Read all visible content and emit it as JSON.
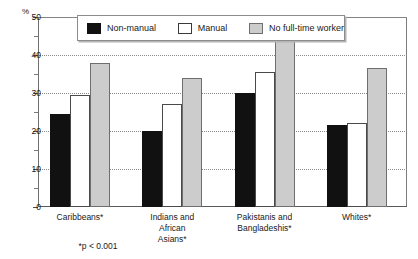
{
  "chart_data": {
    "type": "bar",
    "title": "",
    "subtitle": "",
    "xlabel": "",
    "ylabel": "%",
    "ylim": [
      0,
      50
    ],
    "yticks": [
      0,
      10,
      20,
      30,
      40,
      50
    ],
    "ytick_labels": [
      "0",
      "10",
      "20",
      "30",
      "40",
      "50"
    ],
    "minor_yticks": [
      5,
      15,
      25,
      35,
      45
    ],
    "grid": "horizontal dotted gridlines at major ticks",
    "legend_position": "top-center inside plot",
    "categories": [
      "Caribbeans*",
      "Indians and African Asians*",
      "Pakistanis and Bangladeshis*",
      "Whites*"
    ],
    "series": [
      {
        "name": "Non-manual",
        "color": "#111111",
        "values": [
          24.5,
          20.0,
          30.0,
          21.5
        ]
      },
      {
        "name": "Manual",
        "color": "#ffffff",
        "values": [
          29.5,
          27.0,
          35.5,
          22.0
        ]
      },
      {
        "name": "No full-time worker",
        "color": "#cccccc",
        "values": [
          38.0,
          34.0,
          44.0,
          36.5
        ]
      }
    ],
    "annotations": [
      "*p < 0.001"
    ]
  },
  "axis": {
    "unit_label": "%"
  },
  "legend": {
    "items": [
      {
        "label": "Non-manual"
      },
      {
        "label": "Manual"
      },
      {
        "label": "No full-time worker"
      }
    ]
  },
  "categories_display": [
    {
      "lines": [
        "Caribbeans*"
      ]
    },
    {
      "lines": [
        "Indians and",
        "African",
        "Asians*"
      ]
    },
    {
      "lines": [
        "Pakistanis and",
        "Bangladeshis*"
      ]
    },
    {
      "lines": [
        "Whites*"
      ]
    }
  ],
  "footnote": {
    "text": "*p < 0.001"
  }
}
